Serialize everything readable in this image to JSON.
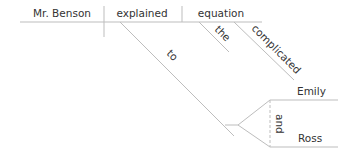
{
  "diagram": {
    "type": "sentence-diagram",
    "subject": "Mr. Benson",
    "verb": "explained",
    "direct_object": "equation",
    "object_modifiers": [
      "the",
      "complicated"
    ],
    "preposition": "to",
    "prepositional_objects": [
      "Emily",
      "Ross"
    ],
    "conjunction": "and",
    "line_color": "#bdbdbd",
    "text_color": "#333333"
  }
}
